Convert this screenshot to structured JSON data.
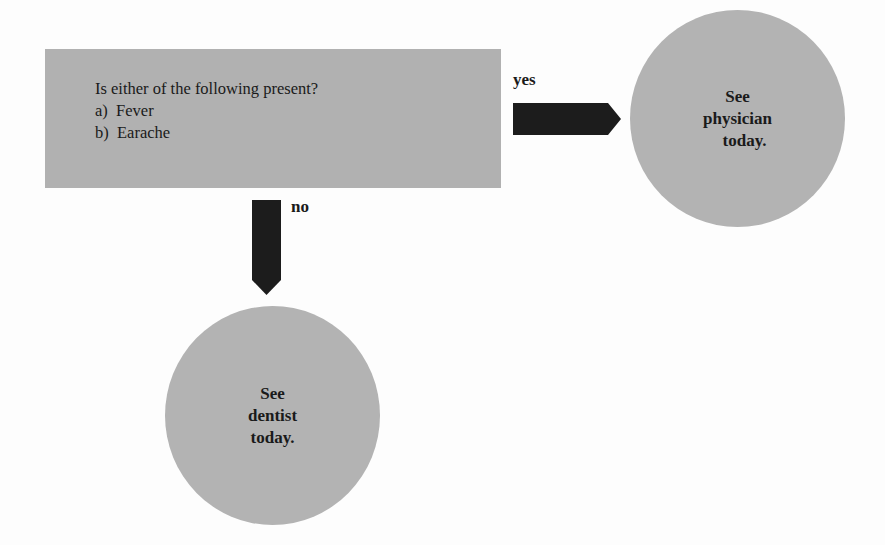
{
  "decision": {
    "question": "Is either of the following present?",
    "options": [
      "a)  Fever",
      "b)  Earache"
    ]
  },
  "branches": {
    "yes": {
      "label": "yes",
      "outcome": [
        "See",
        "physician",
        "today."
      ]
    },
    "no": {
      "label": "no",
      "outcome": [
        "See",
        "dentist",
        "today."
      ]
    }
  },
  "colors": {
    "box": "#b1b1b1",
    "circle": "#b3b3b3",
    "arrow": "#1c1c1c",
    "background": "#fdfdfd"
  }
}
